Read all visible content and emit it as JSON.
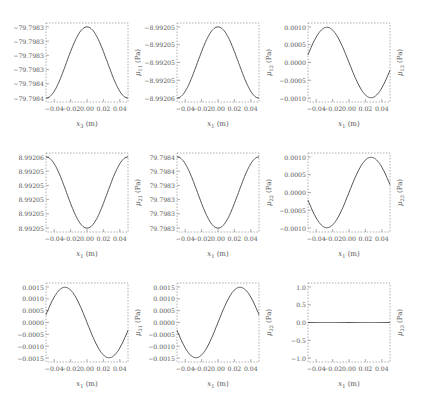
{
  "figure": {
    "layout": "3x3 grid of line plots",
    "line_color": "#555555",
    "frame_color": "#999999"
  },
  "chart_data": [
    {
      "type": "line",
      "row": 0,
      "col": 0,
      "xlabel": "x3 (m)",
      "ylabel": "μ11 (Pa)",
      "xlim": [
        -0.05,
        0.05
      ],
      "xticks": [
        "-0.04",
        "-0.02",
        "0.00",
        "0.02",
        "0.04"
      ],
      "yticks": [
        "-79.7983",
        "-79.7983",
        "-79.7983",
        "-79.7983",
        "-79.7984",
        "-79.7984"
      ],
      "shape": "cos",
      "ylim": [
        -79.79844,
        -79.79828
      ],
      "x": [
        -0.05,
        -0.025,
        0.0,
        0.025,
        0.05
      ],
      "y": [
        -79.79843,
        -79.79836,
        -79.79829,
        -79.79836,
        -79.79843
      ]
    },
    {
      "type": "line",
      "row": 0,
      "col": 1,
      "xlabel": "x1 (m)",
      "ylabel": "μ12 (Pa)",
      "xlim": [
        -0.05,
        0.05
      ],
      "xticks": [
        "-0.04",
        "-0.02",
        "0.00",
        "0.02",
        "0.04"
      ],
      "yticks": [
        "-8.99205",
        "-8.99205",
        "-8.99205",
        "-8.99205",
        "-8.99206"
      ],
      "shape": "cos",
      "ylim": [
        -8.992062,
        -8.992048
      ],
      "x": [
        -0.05,
        -0.025,
        0.0,
        0.025,
        0.05
      ],
      "y": [
        -8.992061,
        -8.992055,
        -8.992049,
        -8.992055,
        -8.992061
      ]
    },
    {
      "type": "line",
      "row": 0,
      "col": 2,
      "xlabel": "x1 (m)",
      "ylabel": "μ13 (Pa)",
      "xlim": [
        -0.05,
        0.05
      ],
      "xticks": [
        "-0.04",
        "-0.02",
        "0.00",
        "0.02",
        "0.04"
      ],
      "yticks": [
        "0.0010",
        "0.0005",
        "0.0000",
        "-0.0005",
        "-0.0010"
      ],
      "shape": "sin",
      "ylim": [
        -0.00135,
        0.00135
      ],
      "x": [
        -0.05,
        -0.03,
        0.0,
        0.03,
        0.05
      ],
      "y": [
        0.0,
        0.0013,
        0.0,
        -0.0013,
        0.0
      ]
    },
    {
      "type": "line",
      "row": 1,
      "col": 0,
      "xlabel": "x1 (m)",
      "ylabel": "μ21 (Pa)",
      "xlim": [
        -0.05,
        0.05
      ],
      "xticks": [
        "-0.04",
        "-0.02",
        "0.00",
        "0.02",
        "0.04"
      ],
      "yticks": [
        "8.99206",
        "8.99205",
        "8.99205",
        "8.99205",
        "8.99205",
        "8.99205"
      ],
      "shape": "negcos",
      "ylim": [
        8.992047,
        8.992062
      ],
      "x": [
        -0.05,
        -0.025,
        0.0,
        0.025,
        0.05
      ],
      "y": [
        8.992061,
        8.992054,
        8.992048,
        8.992054,
        8.992061
      ]
    },
    {
      "type": "line",
      "row": 1,
      "col": 1,
      "xlabel": "x1 (m)",
      "ylabel": "μ22 (Pa)",
      "xlim": [
        -0.05,
        0.05
      ],
      "xticks": [
        "-0.04",
        "-0.02",
        "0.00",
        "0.02",
        "0.04"
      ],
      "yticks": [
        "79.7984",
        "79.7984",
        "79.7983",
        "79.7983",
        "79.7983",
        "79.7983"
      ],
      "shape": "negcos",
      "ylim": [
        79.79828,
        79.79844
      ],
      "x": [
        -0.05,
        -0.025,
        0.0,
        0.025,
        0.05
      ],
      "y": [
        79.79843,
        79.79836,
        79.79829,
        79.79836,
        79.79843
      ]
    },
    {
      "type": "line",
      "row": 1,
      "col": 2,
      "xlabel": "x1 (m)",
      "ylabel": "μ23 (Pa)",
      "xlim": [
        -0.05,
        0.05
      ],
      "xticks": [
        "-0.04",
        "-0.02",
        "0.00",
        "0.02",
        "0.04"
      ],
      "yticks": [
        "0.0010",
        "0.0005",
        "0.0000",
        "-0.0005",
        "-0.0010"
      ],
      "shape": "negsin",
      "ylim": [
        -0.00135,
        0.00135
      ],
      "x": [
        -0.05,
        -0.03,
        0.0,
        0.03,
        0.05
      ],
      "y": [
        0.0,
        -0.0013,
        0.0,
        0.0013,
        0.0
      ]
    },
    {
      "type": "line",
      "row": 2,
      "col": 0,
      "xlabel": "x1 (m)",
      "ylabel": "μ31 (Pa)",
      "xlim": [
        -0.05,
        0.05
      ],
      "xticks": [
        "-0.04",
        "-0.02",
        "0.00",
        "0.02",
        "0.04"
      ],
      "yticks": [
        "0.0015",
        "0.0010",
        "0.0005",
        "0.0000",
        "-0.0005",
        "-0.0010",
        "-0.0015"
      ],
      "shape": "sin",
      "ylim": [
        -0.0018,
        0.0018
      ],
      "x": [
        -0.05,
        -0.03,
        0.0,
        0.03,
        0.05
      ],
      "y": [
        0.0,
        0.0017,
        0.0,
        -0.0017,
        0.0
      ]
    },
    {
      "type": "line",
      "row": 2,
      "col": 1,
      "xlabel": "x1 (m)",
      "ylabel": "μ32 (Pa)",
      "xlim": [
        -0.05,
        0.05
      ],
      "xticks": [
        "-0.04",
        "-0.02",
        "0.00",
        "0.02",
        "0.04"
      ],
      "yticks": [
        "0.0015",
        "0.0010",
        "0.0005",
        "0.0000",
        "-0.0005",
        "-0.0010",
        "-0.0015"
      ],
      "shape": "negsin",
      "ylim": [
        -0.0018,
        0.0018
      ],
      "x": [
        -0.05,
        -0.03,
        0.0,
        0.03,
        0.05
      ],
      "y": [
        0.0,
        -0.0017,
        0.0,
        0.0017,
        0.0
      ]
    },
    {
      "type": "line",
      "row": 2,
      "col": 2,
      "xlabel": "x1 (m)",
      "ylabel": "μ33 (Pa)",
      "xlim": [
        -0.05,
        0.05
      ],
      "xticks": [
        "-0.04",
        "-0.02",
        "0.00",
        "0.02",
        "0.04"
      ],
      "yticks": [
        "1.0",
        "0.5",
        "0.0",
        "-0.5",
        "-1.0"
      ],
      "shape": "zero",
      "ylim": [
        -1.1,
        1.1
      ],
      "x": [
        -0.05,
        0.05
      ],
      "y": [
        0.0,
        0.0
      ]
    }
  ]
}
